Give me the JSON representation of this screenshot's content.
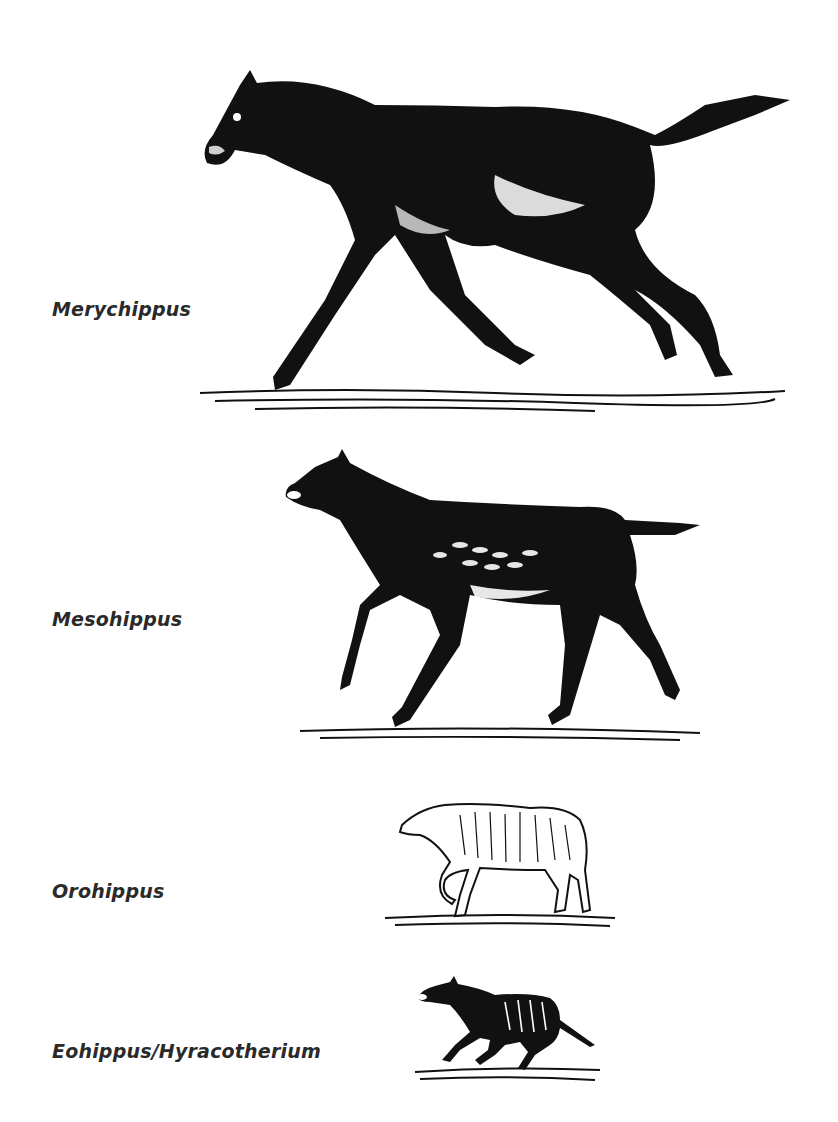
{
  "figure": {
    "species": [
      {
        "name": "Merychippus",
        "order": 1
      },
      {
        "name": "Mesohippus",
        "order": 2
      },
      {
        "name": "Orohippus",
        "order": 3
      },
      {
        "name": "Eohippus/Hyracotherium",
        "order": 4
      }
    ]
  },
  "colors": {
    "ink": "#111111",
    "label": "#2a2a2a",
    "background": "#ffffff"
  }
}
